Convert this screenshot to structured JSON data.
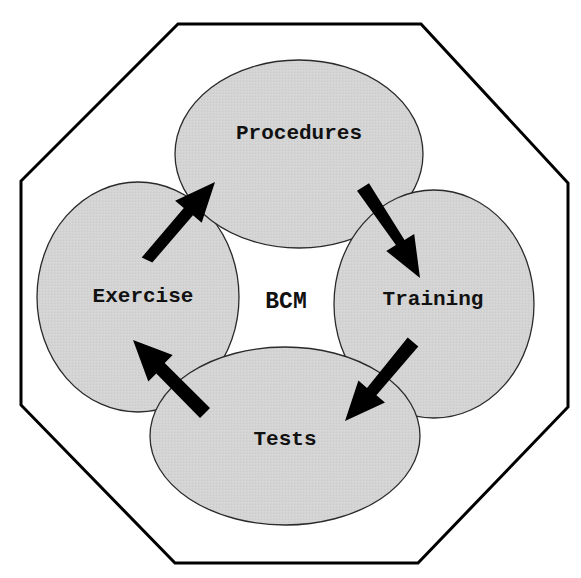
{
  "diagram": {
    "title": "BCM",
    "center_label": "BCM",
    "nodes": [
      {
        "id": "procedures",
        "label": "Procedures"
      },
      {
        "id": "training",
        "label": "Training"
      },
      {
        "id": "tests",
        "label": "Tests"
      },
      {
        "id": "exercise",
        "label": "Exercise"
      }
    ],
    "edges": [
      {
        "from": "procedures",
        "to": "training"
      },
      {
        "from": "training",
        "to": "tests"
      },
      {
        "from": "tests",
        "to": "exercise"
      },
      {
        "from": "exercise",
        "to": "procedures"
      }
    ],
    "colors": {
      "node_fill": "#d3d3d3",
      "node_stroke": "#2a2a2a",
      "arrow": "#000000",
      "frame": "#000000",
      "background": "#ffffff"
    }
  }
}
